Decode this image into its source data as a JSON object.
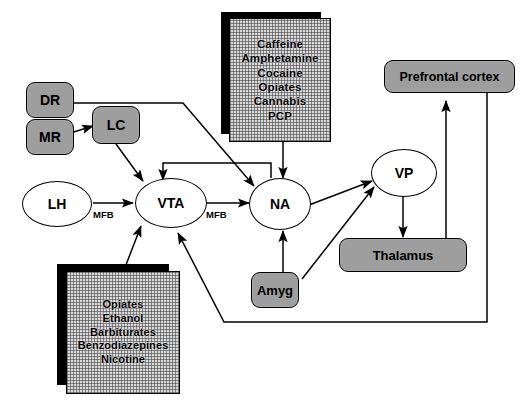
{
  "diagram": {
    "type": "flow-diagram",
    "colors": {
      "node_gray": "#9e9e9e",
      "node_white": "#ffffff",
      "stroke": "#000000",
      "hatch_fill": "#d8d8d8",
      "shadow": "#000000",
      "background": "#ffffff"
    }
  },
  "nodes": {
    "dr": {
      "label": "DR",
      "shape": "rounded-rect",
      "fill": "gray"
    },
    "mr": {
      "label": "MR",
      "shape": "rounded-rect",
      "fill": "gray"
    },
    "lc": {
      "label": "LC",
      "shape": "rounded-rect",
      "fill": "gray"
    },
    "lh": {
      "label": "LH",
      "shape": "ellipse",
      "fill": "white"
    },
    "vta": {
      "label": "VTA",
      "shape": "ellipse",
      "fill": "white"
    },
    "na": {
      "label": "NA",
      "shape": "ellipse",
      "fill": "white"
    },
    "vp": {
      "label": "VP",
      "shape": "ellipse",
      "fill": "white"
    },
    "amyg": {
      "label": "Amyg",
      "shape": "rounded-rect",
      "fill": "gray"
    },
    "thalamus": {
      "label": "Thalamus",
      "shape": "rounded-rect",
      "fill": "gray"
    },
    "prefrontal": {
      "label": "Prefrontal cortex",
      "shape": "rounded-rect",
      "fill": "gray"
    }
  },
  "drug_lists": {
    "top": {
      "name": "na-acting-drugs",
      "items": [
        "Caffeine",
        "Amphetamine",
        "Cocaine",
        "Opiates",
        "Cannabis",
        "PCP"
      ],
      "target": "NA"
    },
    "bottom": {
      "name": "vta-acting-drugs",
      "items": [
        "Opiates",
        "Ethanol",
        "Barbiturates",
        "Benzodiazepines",
        "Nicotine"
      ],
      "target": "VTA"
    }
  },
  "edge_labels": {
    "lh_vta": "MFB",
    "vta_na": "MFB"
  },
  "connections": [
    {
      "from": "MR",
      "to": "LC",
      "arrow": true
    },
    {
      "from": "LC",
      "to": "VTA",
      "arrow": true
    },
    {
      "from": "DR",
      "to": "NA",
      "arrow": true
    },
    {
      "from": "LH",
      "to": "VTA",
      "arrow": true,
      "label": "MFB"
    },
    {
      "from": "VTA",
      "to": "NA",
      "arrow": true,
      "label": "MFB"
    },
    {
      "from": "NA",
      "to": "VTA",
      "arrow": true
    },
    {
      "from": "top-drug-list",
      "to": "NA",
      "arrow": true
    },
    {
      "from": "bottom-drug-list",
      "to": "VTA",
      "arrow": true
    },
    {
      "from": "NA",
      "to": "VP",
      "arrow": true
    },
    {
      "from": "Amyg",
      "to": "NA",
      "arrow": true
    },
    {
      "from": "Amyg",
      "to": "VP",
      "arrow": true
    },
    {
      "from": "VP",
      "to": "Thalamus",
      "arrow": true
    },
    {
      "from": "Thalamus",
      "to": "Prefrontal cortex",
      "arrow": true
    },
    {
      "from": "Prefrontal cortex",
      "to": "VTA",
      "arrow": true
    }
  ]
}
